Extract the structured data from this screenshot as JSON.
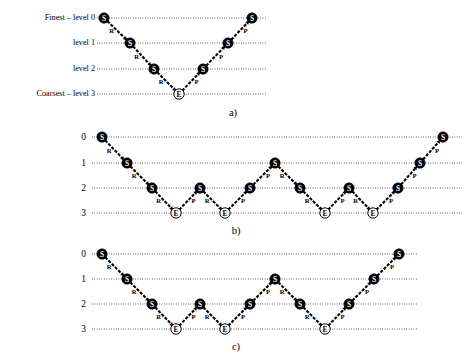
{
  "figure": {
    "width": 469,
    "height": 362,
    "colors": {
      "ink": "#000000",
      "paper": "#ffffff",
      "smoother_fill": "#000000",
      "exact_solve_fill": "#ffffff"
    },
    "node_legend": {
      "S": "S",
      "E": "E"
    },
    "edge_legend": {
      "R": "R",
      "P": "P"
    }
  },
  "panels": [
    {
      "id": "a",
      "caption": "a)",
      "caption_x": 233,
      "caption_y": 116,
      "origin_y": 0,
      "line_x_start": 97,
      "line_x_end": 267,
      "label_x": 95,
      "label_style": "text",
      "levels": [
        {
          "label": "Finest – level 0",
          "value": 0,
          "y": 18
        },
        {
          "label": "level 1",
          "value": 1,
          "y": 43
        },
        {
          "label": "level 2",
          "value": 2,
          "y": 69
        },
        {
          "label": "Coarsest – level 3",
          "value": 3,
          "y": 94
        }
      ],
      "nodes": [
        {
          "type": "S",
          "level": 0,
          "x": 104,
          "y": 18
        },
        {
          "type": "S",
          "level": 1,
          "x": 130,
          "y": 43
        },
        {
          "type": "S",
          "level": 2,
          "x": 154,
          "y": 69
        },
        {
          "type": "E",
          "level": 3,
          "x": 179,
          "y": 94
        },
        {
          "type": "S",
          "level": 2,
          "x": 203,
          "y": 69
        },
        {
          "type": "S",
          "level": 1,
          "x": 228,
          "y": 43
        },
        {
          "type": "S",
          "level": 0,
          "x": 252,
          "y": 18
        }
      ],
      "edges": [
        {
          "from": 0,
          "to": 1,
          "label": "R"
        },
        {
          "from": 1,
          "to": 2,
          "label": "R"
        },
        {
          "from": 2,
          "to": 3,
          "label": "R"
        },
        {
          "from": 3,
          "to": 4,
          "label": "P"
        },
        {
          "from": 4,
          "to": 5,
          "label": "P"
        },
        {
          "from": 5,
          "to": 6,
          "label": "P"
        }
      ]
    },
    {
      "id": "b",
      "caption": "b)",
      "caption_x": 236,
      "caption_y": 234,
      "origin_y": 0,
      "line_x_start": 92,
      "line_x_end": 462,
      "label_x": 86,
      "label_style": "number",
      "levels": [
        {
          "label": "0",
          "value": 0,
          "y": 137
        },
        {
          "label": "1",
          "value": 1,
          "y": 163
        },
        {
          "label": "2",
          "value": 2,
          "y": 188
        },
        {
          "label": "3",
          "value": 3,
          "y": 213
        }
      ],
      "nodes": [
        {
          "type": "S",
          "level": 0,
          "x": 102,
          "y": 137
        },
        {
          "type": "S",
          "level": 1,
          "x": 127,
          "y": 163
        },
        {
          "type": "S",
          "level": 2,
          "x": 152,
          "y": 188
        },
        {
          "type": "E",
          "level": 3,
          "x": 176,
          "y": 213
        },
        {
          "type": "S",
          "level": 2,
          "x": 200,
          "y": 188
        },
        {
          "type": "E",
          "level": 3,
          "x": 225,
          "y": 213
        },
        {
          "type": "S",
          "level": 2,
          "x": 250,
          "y": 188
        },
        {
          "type": "S",
          "level": 1,
          "x": 275,
          "y": 163
        },
        {
          "type": "S",
          "level": 2,
          "x": 300,
          "y": 188
        },
        {
          "type": "E",
          "level": 3,
          "x": 325,
          "y": 213
        },
        {
          "type": "S",
          "level": 2,
          "x": 349,
          "y": 188
        },
        {
          "type": "E",
          "level": 3,
          "x": 373,
          "y": 213
        },
        {
          "type": "S",
          "level": 2,
          "x": 398,
          "y": 188
        },
        {
          "type": "S",
          "level": 1,
          "x": 420,
          "y": 163
        },
        {
          "type": "S",
          "level": 0,
          "x": 443,
          "y": 137
        }
      ],
      "edges": [
        {
          "from": 0,
          "to": 1,
          "label": "R"
        },
        {
          "from": 1,
          "to": 2,
          "label": "R"
        },
        {
          "from": 2,
          "to": 3,
          "label": "R"
        },
        {
          "from": 3,
          "to": 4,
          "label": "P"
        },
        {
          "from": 4,
          "to": 5,
          "label": "R"
        },
        {
          "from": 5,
          "to": 6,
          "label": "P"
        },
        {
          "from": 6,
          "to": 7,
          "label": "P"
        },
        {
          "from": 7,
          "to": 8,
          "label": "R"
        },
        {
          "from": 8,
          "to": 9,
          "label": "R"
        },
        {
          "from": 9,
          "to": 10,
          "label": "P"
        },
        {
          "from": 10,
          "to": 11,
          "label": "R"
        },
        {
          "from": 11,
          "to": 12,
          "label": "P"
        },
        {
          "from": 12,
          "to": 13,
          "label": "P"
        },
        {
          "from": 13,
          "to": 14,
          "label": "P"
        }
      ]
    },
    {
      "id": "c",
      "caption": "c)",
      "caption_x": 236,
      "caption_y": 350,
      "origin_y": 0,
      "line_x_start": 92,
      "line_x_end": 418,
      "label_x": 86,
      "label_style": "number",
      "levels": [
        {
          "label": "0",
          "value": 0,
          "y": 254
        },
        {
          "label": "1",
          "value": 1,
          "y": 279
        },
        {
          "label": "2",
          "value": 2,
          "y": 304
        },
        {
          "label": "3",
          "value": 3,
          "y": 329
        }
      ],
      "nodes": [
        {
          "type": "S",
          "level": 0,
          "x": 102,
          "y": 254
        },
        {
          "type": "S",
          "level": 1,
          "x": 127,
          "y": 279
        },
        {
          "type": "S",
          "level": 2,
          "x": 152,
          "y": 304
        },
        {
          "type": "E",
          "level": 3,
          "x": 176,
          "y": 329
        },
        {
          "type": "S",
          "level": 2,
          "x": 200,
          "y": 304
        },
        {
          "type": "E",
          "level": 3,
          "x": 225,
          "y": 329
        },
        {
          "type": "S",
          "level": 2,
          "x": 250,
          "y": 304
        },
        {
          "type": "S",
          "level": 1,
          "x": 275,
          "y": 279
        },
        {
          "type": "S",
          "level": 2,
          "x": 300,
          "y": 304
        },
        {
          "type": "E",
          "level": 3,
          "x": 325,
          "y": 329
        },
        {
          "type": "S",
          "level": 2,
          "x": 349,
          "y": 304
        },
        {
          "type": "S",
          "level": 1,
          "x": 374,
          "y": 279
        },
        {
          "type": "S",
          "level": 0,
          "x": 399,
          "y": 254
        }
      ],
      "edges": [
        {
          "from": 0,
          "to": 1,
          "label": "R"
        },
        {
          "from": 1,
          "to": 2,
          "label": "R"
        },
        {
          "from": 2,
          "to": 3,
          "label": "R"
        },
        {
          "from": 3,
          "to": 4,
          "label": "P"
        },
        {
          "from": 4,
          "to": 5,
          "label": "R"
        },
        {
          "from": 5,
          "to": 6,
          "label": "P"
        },
        {
          "from": 6,
          "to": 7,
          "label": "P"
        },
        {
          "from": 7,
          "to": 8,
          "label": "R"
        },
        {
          "from": 8,
          "to": 9,
          "label": "R"
        },
        {
          "from": 9,
          "to": 10,
          "label": "P"
        },
        {
          "from": 10,
          "to": 11,
          "label": "P"
        },
        {
          "from": 11,
          "to": 12,
          "label": "P"
        }
      ]
    }
  ]
}
